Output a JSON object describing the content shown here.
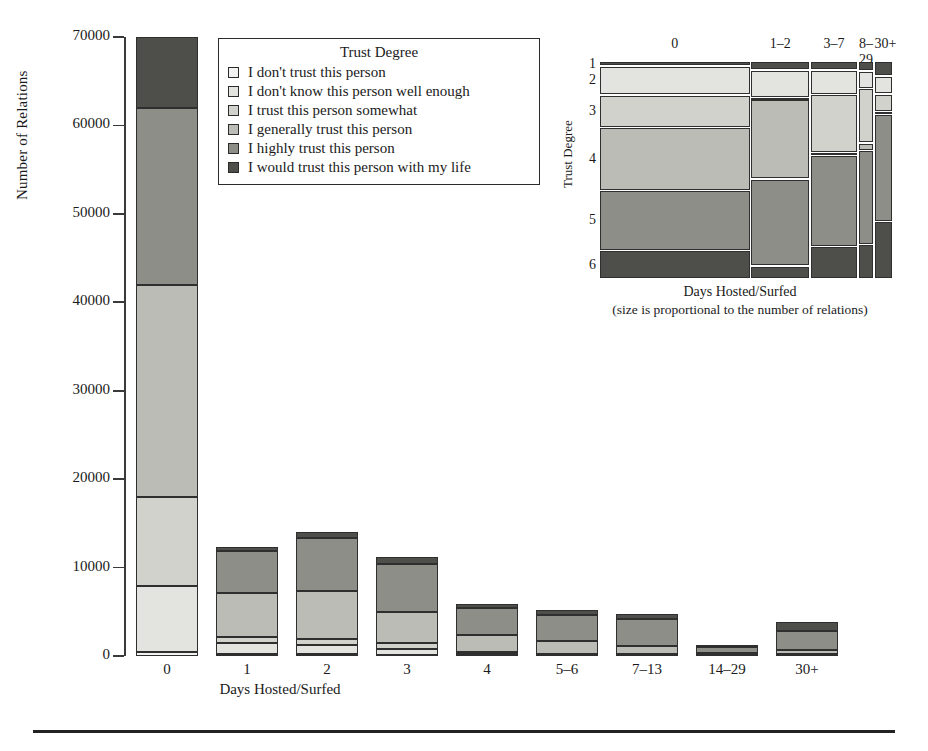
{
  "chart_data": {
    "type": "bar",
    "title": "",
    "xlabel": "Days Hosted/Surfed",
    "ylabel": "Number of Relations",
    "ylim": [
      0,
      70000
    ],
    "yticks": [
      "0",
      "10000",
      "20000",
      "30000",
      "40000",
      "50000",
      "60000",
      "70000"
    ],
    "ytick_values": [
      0,
      10000,
      20000,
      30000,
      40000,
      50000,
      60000,
      70000
    ],
    "categories": [
      "0",
      "1",
      "2",
      "3",
      "4",
      "5–6",
      "7–13",
      "14–29",
      "30+"
    ],
    "stacked": true,
    "grid": false,
    "legend_position": "top-center",
    "legend_title": "Trust Degree",
    "series": [
      {
        "name": "I don't trust this person",
        "code": 1,
        "color": "#f2f2f0",
        "values": [
          500,
          250,
          200,
          150,
          80,
          60,
          50,
          20,
          40
        ]
      },
      {
        "name": "I don't know this person well enough",
        "code": 2,
        "color": "#e3e3df",
        "values": [
          7400,
          1250,
          1100,
          600,
          150,
          100,
          80,
          30,
          60
        ]
      },
      {
        "name": "I trust this person somewhat",
        "code": 3,
        "color": "#d2d2cd",
        "values": [
          10100,
          700,
          600,
          700,
          200,
          120,
          110,
          40,
          80
        ]
      },
      {
        "name": "I generally trust this person",
        "code": 4,
        "color": "#bcbcb6",
        "values": [
          24000,
          4950,
          5500,
          3550,
          1950,
          1400,
          900,
          300,
          520
        ]
      },
      {
        "name": "I highly trust this person",
        "code": 5,
        "color": "#8e8e88",
        "values": [
          20000,
          4700,
          5900,
          5400,
          3000,
          3000,
          3000,
          620,
          2100
        ]
      },
      {
        "name": "I would trust this person with my life",
        "code": 6,
        "color": "#4e4e4a",
        "values": [
          8000,
          450,
          700,
          800,
          500,
          550,
          650,
          90,
          1100
        ]
      }
    ],
    "totals": [
      70000,
      12300,
      14000,
      11200,
      5880,
      5230,
      4790,
      1100,
      3900
    ]
  },
  "mosaic_chart": {
    "type": "heatmap",
    "xlabel": "Days Hosted/Surfed",
    "ylabel": "Trust Degree",
    "note": "(size is proportional to the number of relations)",
    "columns": [
      {
        "label": "0",
        "width_pct": 48.5
      },
      {
        "label": "1–2",
        "width_pct": 19.0
      },
      {
        "label": "3–7",
        "width_pct": 15.5
      },
      {
        "label": "8–29",
        "width_pct": 5.0
      },
      {
        "label": "30+",
        "width_pct": 6.0
      }
    ],
    "rows": [
      "1",
      "2",
      "3",
      "4",
      "5",
      "6"
    ],
    "row_colors": [
      "#4e4e4a",
      "#e3e3df",
      "#d2d2cd",
      "#bcbcb6",
      "#8e8e88",
      "#4e4e4a"
    ],
    "cells": [
      {
        "col": 0,
        "heights": [
          2.2,
          12.6,
          14.4,
          27.6,
          26.4,
          12.6
        ]
      },
      {
        "col": 1,
        "heights": [
          3.6,
          11.0,
          0.8,
          32.0,
          35.0,
          5.2
        ]
      },
      {
        "col": 2,
        "heights": [
          3.6,
          9.6,
          23.0,
          1.2,
          36.0,
          13.0
        ]
      },
      {
        "col": 3,
        "heights": [
          4.0,
          7.0,
          22.0,
          3.0,
          38.0,
          14.0
        ]
      },
      {
        "col": 4,
        "heights": [
          6.0,
          7.0,
          7.0,
          1.0,
          43.0,
          23.0
        ]
      }
    ]
  },
  "legend": {
    "title": "Trust Degree",
    "items": [
      "I don't trust this person",
      "I don't know this person well enough",
      "I trust this person somewhat",
      "I generally trust this person",
      "I highly trust this person",
      "I would trust this person with my life"
    ]
  },
  "colors": {
    "level1": "#f2f2f0",
    "level2": "#e3e3df",
    "level3": "#d2d2cd",
    "level4": "#bcbcb6",
    "level5": "#8e8e88",
    "level6": "#4e4e4a",
    "outline": "#2f2f2f",
    "axis": "#3a3a3a"
  }
}
